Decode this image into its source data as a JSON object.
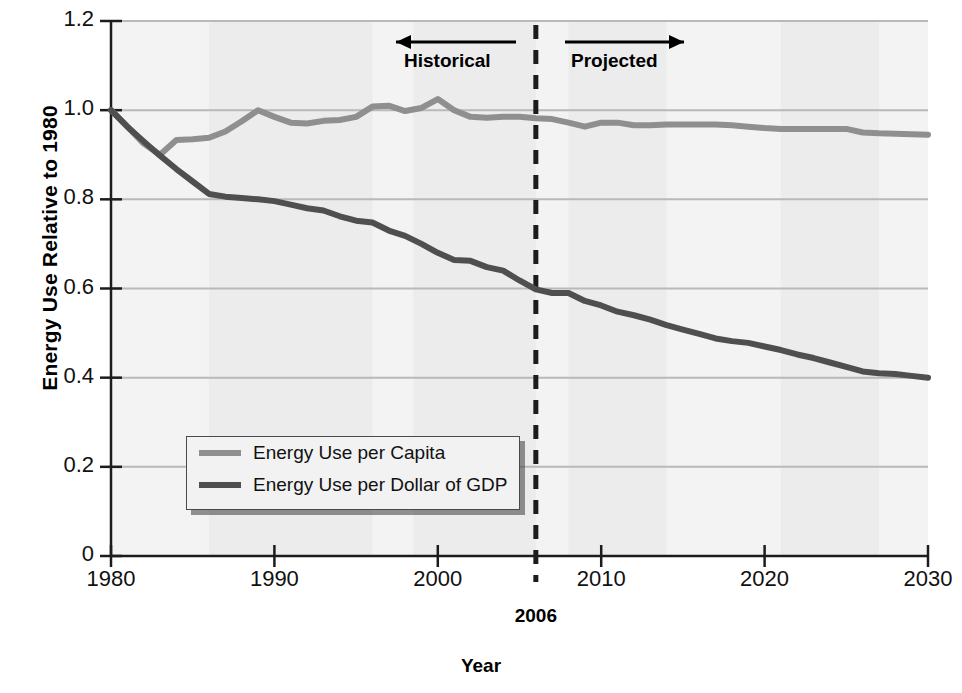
{
  "chart_data": {
    "type": "line",
    "title": "",
    "xlabel": "Year",
    "ylabel": "Energy Use Relative to 1980",
    "xlim": [
      1980,
      2030
    ],
    "ylim": [
      0,
      1.2
    ],
    "grid": "horizontal",
    "legend_position": "inside-lower-left",
    "ytick_labels": [
      "1.2",
      "1.0",
      "0.8",
      "0.6",
      "0.4",
      "0.2",
      "0"
    ],
    "ytick_values": [
      1.2,
      1.0,
      0.8,
      0.6,
      0.4,
      0.2,
      0
    ],
    "xtick_labels": [
      "1980",
      "1990",
      "2000",
      "2010",
      "2020",
      "2030"
    ],
    "xtick_values": [
      1980,
      1990,
      2000,
      2010,
      2020,
      2030
    ],
    "divider": {
      "label": "2006",
      "value": 2006,
      "style": "dashed-vertical"
    },
    "annotations": [
      {
        "text": "Historical",
        "arrow": "left",
        "region": [
          1980,
          2006
        ]
      },
      {
        "text": "Projected",
        "arrow": "right",
        "region": [
          2006,
          2030
        ]
      }
    ],
    "x": [
      1980,
      1981,
      1982,
      1983,
      1984,
      1985,
      1986,
      1987,
      1988,
      1989,
      1990,
      1991,
      1992,
      1993,
      1994,
      1995,
      1996,
      1997,
      1998,
      1999,
      2000,
      2001,
      2002,
      2003,
      2004,
      2005,
      2006,
      2007,
      2008,
      2009,
      2010,
      2011,
      2012,
      2013,
      2014,
      2015,
      2016,
      2017,
      2018,
      2019,
      2020,
      2021,
      2022,
      2023,
      2024,
      2025,
      2026,
      2027,
      2028,
      2029,
      2030
    ],
    "series": [
      {
        "name": "Energy Use per Capita",
        "color": "#8f8f8f",
        "values": [
          1.0,
          0.963,
          0.925,
          0.9,
          0.933,
          0.935,
          0.938,
          0.952,
          0.975,
          1.0,
          0.985,
          0.972,
          0.97,
          0.976,
          0.978,
          0.985,
          1.008,
          1.01,
          0.998,
          1.005,
          1.025,
          1.0,
          0.985,
          0.983,
          0.985,
          0.985,
          0.982,
          0.98,
          0.972,
          0.963,
          0.972,
          0.972,
          0.966,
          0.966,
          0.968,
          0.968,
          0.968,
          0.968,
          0.966,
          0.963,
          0.96,
          0.958,
          0.958,
          0.958,
          0.958,
          0.958,
          0.95,
          0.948,
          0.947,
          0.946,
          0.945
        ]
      },
      {
        "name": "Energy Use per Dollar of GDP",
        "color": "#4f4f4f",
        "values": [
          1.0,
          0.963,
          0.93,
          0.898,
          0.868,
          0.84,
          0.812,
          0.806,
          0.803,
          0.8,
          0.796,
          0.788,
          0.78,
          0.775,
          0.762,
          0.752,
          0.748,
          0.73,
          0.718,
          0.7,
          0.68,
          0.664,
          0.662,
          0.648,
          0.64,
          0.618,
          0.598,
          0.59,
          0.59,
          0.572,
          0.562,
          0.548,
          0.54,
          0.53,
          0.518,
          0.508,
          0.498,
          0.488,
          0.482,
          0.478,
          0.47,
          0.462,
          0.452,
          0.444,
          0.434,
          0.424,
          0.414,
          0.41,
          0.408,
          0.404,
          0.4
        ]
      }
    ]
  },
  "axes": {
    "y_title": "Energy Use Relative to 1980",
    "x_title": "Year"
  },
  "legend": {
    "items": [
      {
        "label": "Energy Use per Capita",
        "color": "#8f8f8f"
      },
      {
        "label": "Energy Use per Dollar of GDP",
        "color": "#4f4f4f"
      }
    ]
  },
  "annotations": {
    "historical": "Historical",
    "projected": "Projected",
    "divider_label": "2006"
  },
  "colors": {
    "per_capita": "#8f8f8f",
    "per_gdp": "#4f4f4f",
    "grid": "#b9b9b9",
    "axis": "#1c1c1c",
    "plot_bg": "#f3f3f3",
    "band": "#eaeaea"
  }
}
